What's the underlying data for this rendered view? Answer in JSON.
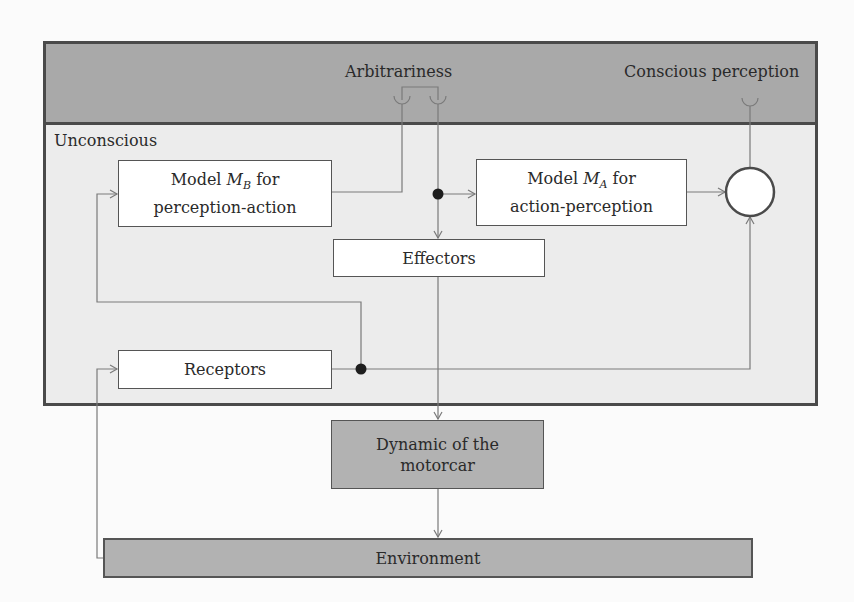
{
  "diagram": {
    "zones": {
      "conscious_band_label_left": "Arbitrariness",
      "conscious_band_label_right": "Conscious perception",
      "unconscious_label": "Unconscious"
    },
    "blocks": {
      "model_b": {
        "prefix": "Model ",
        "symbol": "M",
        "subscript": "B",
        "suffix": " for",
        "line2": "perception-action"
      },
      "model_a": {
        "prefix": "Model ",
        "symbol": "M",
        "subscript": "A",
        "suffix": " for",
        "line2": "action-perception"
      },
      "effectors": "Effectors",
      "receptors": "Receptors",
      "motorcar": {
        "line1": "Dynamic of the",
        "line2": "motorcar"
      },
      "environment": "Environment"
    },
    "nodes": {
      "comparator": "comparator-circle",
      "junction_top": "junction-dot",
      "junction_bottom": "junction-dot"
    },
    "colors": {
      "conscious_band": "#a9a9a9",
      "unconscious_area": "#ececec",
      "block_fill": "#ffffff",
      "external_block_fill": "#b2b2b2",
      "border": "#4a4a4a",
      "wire": "#7a7a7a"
    }
  }
}
